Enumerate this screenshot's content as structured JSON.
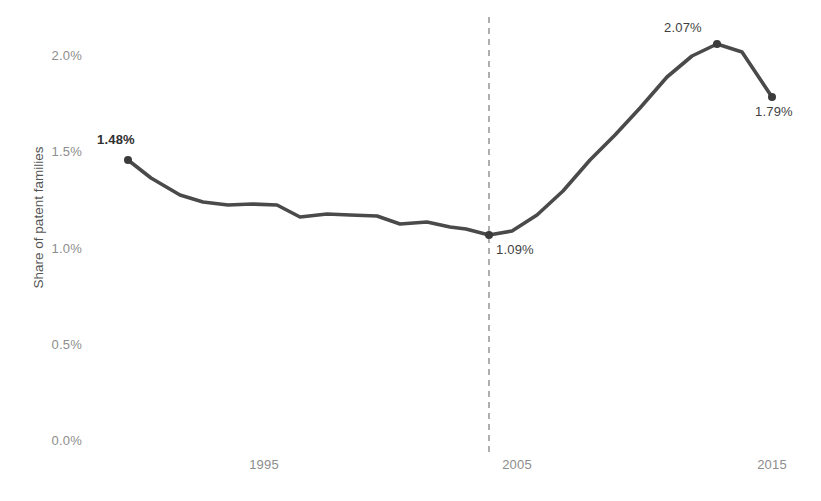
{
  "chart_data": {
    "type": "line",
    "title": "",
    "xlabel": "",
    "ylabel": "Share of patent families",
    "x": [
      1991,
      1992,
      1993,
      1994,
      1995,
      1996,
      1997,
      1998,
      1999,
      2000,
      2001,
      2002,
      2003,
      2004,
      2005,
      2006,
      2007,
      2008,
      2009,
      2010,
      2011,
      2012,
      2013,
      2014,
      2015
    ],
    "values": [
      1.48,
      1.39,
      1.31,
      1.26,
      1.25,
      1.25,
      1.25,
      1.18,
      1.19,
      1.2,
      1.19,
      1.14,
      1.15,
      1.13,
      1.12,
      1.09,
      1.12,
      1.21,
      1.33,
      1.48,
      1.58,
      1.74,
      1.88,
      1.99,
      2.05
    ],
    "series": [
      {
        "name": "Share of patent families",
        "values": [
          1.48,
          1.39,
          1.31,
          1.26,
          1.25,
          1.25,
          1.25,
          1.18,
          1.19,
          1.2,
          1.19,
          1.14,
          1.15,
          1.13,
          1.12,
          1.09,
          1.12,
          1.21,
          1.33,
          1.48,
          1.58,
          1.74,
          1.88,
          1.99,
          2.05
        ]
      }
    ],
    "xticks": [
      1995,
      2005,
      2015
    ],
    "xtick_labels": [
      "1995",
      "2005",
      "2015"
    ],
    "yticks": [
      0.0,
      0.5,
      1.0,
      1.5,
      2.0
    ],
    "ytick_labels": [
      "0.0%",
      "0.5%",
      "1.0%",
      "1.5%",
      "2.0%"
    ],
    "ylim": [
      0.0,
      2.2
    ],
    "xlim": [
      1990.3,
      2016.6
    ],
    "grid": false,
    "legend": "none",
    "line_color": "#4a4a4a",
    "marker_color": "#3b3b3b",
    "tick_color": "#8d8d8d",
    "reference_line": {
      "type": "vertical-dashed",
      "x": 2003.9,
      "color": "#9b9b9b",
      "label": ""
    },
    "annotations": [
      {
        "name": "start-value",
        "text": "1.48%",
        "x": 1991,
        "y": 1.48,
        "marker": true,
        "bold": true
      },
      {
        "name": "reference-value",
        "text": "1.09%",
        "x": 2003.9,
        "y": 1.09,
        "marker": true,
        "bold": false
      },
      {
        "name": "peak-value",
        "text": "2.07%",
        "x": 2012.9,
        "y": 2.07,
        "marker": true,
        "bold": false
      },
      {
        "name": "end-value",
        "text": "1.79%",
        "x": 2015.3,
        "y": 1.79,
        "marker": true,
        "bold": false
      }
    ],
    "points_px": [
      [
        128,
        160
      ],
      [
        151,
        178
      ],
      [
        180,
        195
      ],
      [
        203,
        202
      ],
      [
        228,
        205
      ],
      [
        252,
        204
      ],
      [
        277,
        205
      ],
      [
        300,
        217
      ],
      [
        327,
        214
      ],
      [
        350,
        215
      ],
      [
        377,
        216
      ],
      [
        400,
        224
      ],
      [
        427,
        222
      ],
      [
        450,
        227
      ],
      [
        466,
        229
      ],
      [
        489,
        235
      ],
      [
        512,
        231
      ],
      [
        537,
        215
      ],
      [
        563,
        191
      ],
      [
        590,
        160
      ],
      [
        615,
        135
      ],
      [
        640,
        108
      ],
      [
        667,
        77
      ],
      [
        692,
        56
      ],
      [
        717,
        44
      ],
      [
        742,
        52
      ],
      [
        772,
        97
      ]
    ],
    "marker_points_px": [
      [
        128,
        160
      ],
      [
        489,
        235
      ],
      [
        717,
        44
      ],
      [
        772,
        97
      ]
    ]
  }
}
